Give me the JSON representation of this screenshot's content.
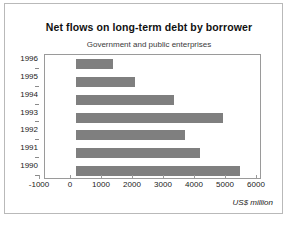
{
  "chart_data": {
    "type": "bar",
    "orientation": "horizontal",
    "title": "Net flows on long-term debt by borrower",
    "subtitle": "Government and public enterprises",
    "xlabel": "US$ million",
    "ylabel": "",
    "categories": [
      "1996",
      "1995",
      "1994",
      "1993",
      "1992",
      "1991",
      "1990"
    ],
    "values": [
      1200,
      1900,
      3150,
      4750,
      3500,
      4000,
      5300
    ],
    "xlim": [
      -1000,
      6000
    ],
    "xticks": [
      -1000,
      0,
      1000,
      2000,
      3000,
      4000,
      5000,
      6000
    ],
    "xticklabels": [
      "-1000",
      "0",
      "1000",
      "2000",
      "3000",
      "4000",
      "5000",
      "6000"
    ],
    "grid": false,
    "legend": false,
    "bar_color": "#7f7f7f",
    "axis_color": "#9a9a9a",
    "background": "#ffffff"
  }
}
